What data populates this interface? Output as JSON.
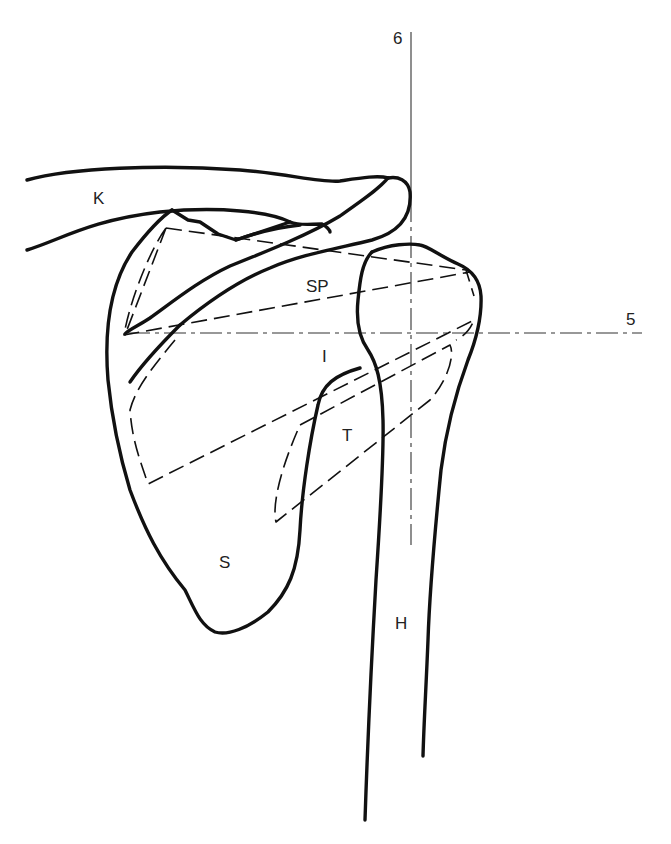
{
  "diagram": {
    "colors": {
      "line": "#111111",
      "background": "#ffffff"
    },
    "labels": {
      "clavicle": "K",
      "supraspinatus": "SP",
      "infraspinatus": "I",
      "teres_minor": "T",
      "scapula": "S",
      "humerus": "H",
      "axis_vertical": "6",
      "axis_horizontal": "5"
    }
  }
}
